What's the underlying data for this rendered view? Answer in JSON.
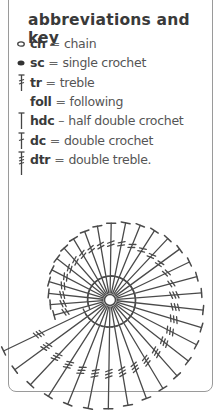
{
  "key": {
    "title": "abbreviations and key",
    "items": [
      {
        "symbol": "chain-oval-icon",
        "abbr": "ch",
        "eq": "=",
        "def": "chain"
      },
      {
        "symbol": "single-crochet-dot-icon",
        "abbr": "sc",
        "eq": "=",
        "def": "single crochet"
      },
      {
        "symbol": "treble-stitch-icon",
        "abbr": "tr",
        "eq": "=",
        "def": "treble"
      },
      {
        "symbol": "none",
        "abbr": "foll",
        "eq": "=",
        "def": "following"
      },
      {
        "symbol": "half-double-crochet-icon",
        "abbr": "hdc",
        "eq": "–",
        "def": "half double crochet"
      },
      {
        "symbol": "double-crochet-icon",
        "abbr": "dc",
        "eq": "=",
        "def": "double crochet"
      },
      {
        "symbol": "double-treble-icon",
        "abbr": "dtr",
        "eq": "=",
        "def": "double treble."
      }
    ]
  },
  "diagram": {
    "type": "spiral crochet chart",
    "center": [
      110,
      300
    ],
    "ring_radius": 5.5,
    "stroke_color": "#4a4a4a",
    "frame_color": "#9a9a9a"
  }
}
